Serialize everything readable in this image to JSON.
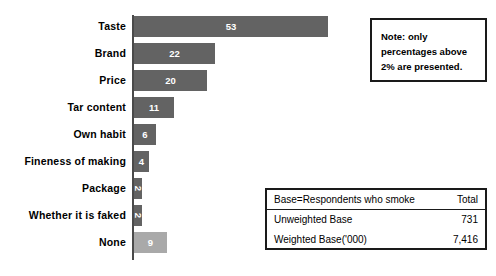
{
  "chart_data": {
    "type": "bar",
    "orientation": "horizontal",
    "title": "",
    "xlabel": "",
    "ylabel": "",
    "xlim": [
      0,
      53
    ],
    "grid": false,
    "legend": false,
    "categories": [
      "Taste",
      "Brand",
      "Price",
      "Tar content",
      "Own habit",
      "Fineness of making",
      "Package",
      "Whether it is faked",
      "None"
    ],
    "values": [
      53,
      22,
      20,
      11,
      6,
      4,
      2,
      2,
      9
    ],
    "value_labels": [
      "53",
      "22",
      "20",
      "11",
      "6",
      "4",
      "2",
      "2",
      "9"
    ],
    "bar_colors": [
      "#636363",
      "#636363",
      "#636363",
      "#636363",
      "#636363",
      "#636363",
      "#636363",
      "#636363",
      "#a9a9a9"
    ],
    "units": "percent"
  },
  "note_box": {
    "lines": [
      "Note: only",
      "percentages above",
      "2% are presented."
    ]
  },
  "base_table": {
    "header": {
      "label": "Base=Respondents who smoke",
      "value": "Total"
    },
    "rows": [
      {
        "label": "Unweighted Base",
        "value": "731"
      },
      {
        "label": "Weighted Base('000)",
        "value": "7,416"
      }
    ]
  }
}
